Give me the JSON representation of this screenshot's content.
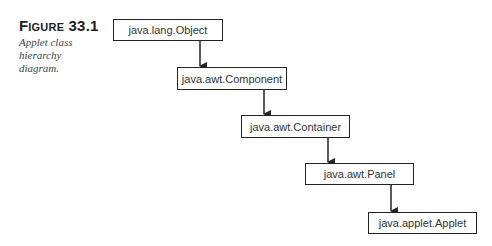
{
  "figure": {
    "title": "Figure 33.1",
    "description": "Applet class hierarchy diagram."
  },
  "nodes": [
    {
      "id": "object",
      "label": "java.lang.Object",
      "x": 113,
      "y": 19,
      "w": 110,
      "h": 22
    },
    {
      "id": "component",
      "label": "java.awt.Component",
      "x": 177,
      "y": 67,
      "w": 110,
      "h": 23
    },
    {
      "id": "container",
      "label": "java.awt.Container",
      "x": 241,
      "y": 115,
      "w": 109,
      "h": 23
    },
    {
      "id": "panel",
      "label": "java.awt.Panel",
      "x": 305,
      "y": 163,
      "w": 109,
      "h": 22
    },
    {
      "id": "applet",
      "label": "java.applet.Applet",
      "x": 368,
      "y": 212,
      "w": 109,
      "h": 22
    }
  ],
  "edges": [
    {
      "from": "object",
      "to": "component"
    },
    {
      "from": "component",
      "to": "container"
    },
    {
      "from": "container",
      "to": "panel"
    },
    {
      "from": "panel",
      "to": "applet"
    }
  ],
  "colors": {
    "stroke": "#222222",
    "text": "#333333",
    "background": "#ffffff"
  }
}
